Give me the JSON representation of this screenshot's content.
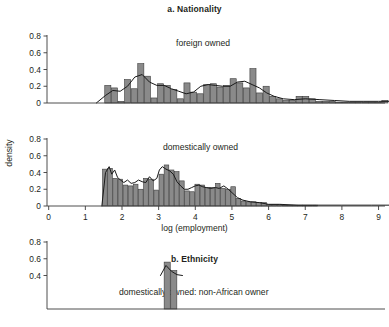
{
  "figure": {
    "panel_a_title": "a. Nationality",
    "panel_b_title": "b. Ethnicity",
    "ylabel": "density",
    "xlabel": "log (employment)",
    "bar_fill": "#8a8a8a",
    "bar_stroke": "#3b3b3b",
    "curve_color": "#1a1a1a",
    "axis_color": "#3b3b3b"
  },
  "chart_data": [
    {
      "type": "bar",
      "title": "a. Nationality",
      "series_label": "foreign owned",
      "panel": "top",
      "xlabel": "",
      "ylabel": "density",
      "xlim": [
        -0.3,
        9.4
      ],
      "ylim": [
        0,
        0.9
      ],
      "xticks": [
        0,
        1,
        2,
        3,
        4,
        5,
        6,
        7,
        8,
        9
      ],
      "yticks": [
        0,
        0.2,
        0.4,
        0.6,
        0.8
      ],
      "ytick_labels": [
        "0",
        "0.2",
        "0.4",
        "0.6",
        "0.8"
      ],
      "grid": false,
      "bin_width": 0.18,
      "bin_starts": [
        1.53,
        1.71,
        1.89,
        2.07,
        2.25,
        2.43,
        2.61,
        2.79,
        2.97,
        3.15,
        3.33,
        3.51,
        3.69,
        3.87,
        4.05,
        4.23,
        4.41,
        4.59,
        4.77,
        4.95,
        5.13,
        5.31,
        5.49,
        5.67,
        5.85,
        6.03,
        6.21,
        6.39,
        6.57,
        6.75,
        6.93,
        7.11,
        7.29,
        7.47,
        7.65,
        7.83,
        8.01,
        8.19,
        8.37,
        8.55,
        8.73,
        8.91,
        9.09
      ],
      "values": [
        0.21,
        0.18,
        0.02,
        0.28,
        0.17,
        0.47,
        0.32,
        0.06,
        0.23,
        0.21,
        0.16,
        0.05,
        0.24,
        0.13,
        0.11,
        0.22,
        0.23,
        0.19,
        0.21,
        0.29,
        0.24,
        0.18,
        0.41,
        0.12,
        0.2,
        0.08,
        0.05,
        0.03,
        0.03,
        0.08,
        0.08,
        0.05,
        0.02,
        0.02,
        0.02,
        0.01,
        0.01,
        0.01,
        0.01,
        0.01,
        0.01,
        0.01,
        0.03
      ],
      "density_curve": {
        "x": [
          1.3,
          1.55,
          1.75,
          1.95,
          2.15,
          2.35,
          2.55,
          2.75,
          2.95,
          3.15,
          3.35,
          3.55,
          3.75,
          3.95,
          4.15,
          4.35,
          4.55,
          4.75,
          4.95,
          5.15,
          5.35,
          5.55,
          5.75,
          5.95,
          6.15,
          6.4,
          6.7,
          7.0,
          7.4,
          7.8,
          8.2,
          8.6,
          9.0,
          9.3
        ],
        "y": [
          0.0,
          0.09,
          0.15,
          0.14,
          0.2,
          0.31,
          0.34,
          0.25,
          0.21,
          0.21,
          0.17,
          0.14,
          0.11,
          0.13,
          0.2,
          0.22,
          0.21,
          0.2,
          0.2,
          0.25,
          0.26,
          0.22,
          0.18,
          0.12,
          0.08,
          0.05,
          0.04,
          0.05,
          0.04,
          0.03,
          0.02,
          0.02,
          0.02,
          0.02
        ]
      }
    },
    {
      "type": "bar",
      "title": "a. Nationality",
      "series_label": "domestically owned",
      "panel": "middle",
      "xlabel": "log (employment)",
      "ylabel": "density",
      "xlim": [
        -0.3,
        9.4
      ],
      "ylim": [
        0,
        0.9
      ],
      "xticks": [
        0,
        1,
        2,
        3,
        4,
        5,
        6,
        7,
        8,
        9
      ],
      "yticks": [
        0,
        0.2,
        0.4,
        0.6,
        0.8
      ],
      "ytick_labels": [
        "0",
        "0.2",
        "0.4",
        "0.6",
        "0.8"
      ],
      "grid": false,
      "bin_width": 0.14,
      "bin_starts": [
        1.47,
        1.61,
        1.75,
        1.89,
        2.03,
        2.17,
        2.31,
        2.45,
        2.59,
        2.73,
        2.87,
        3.01,
        3.15,
        3.29,
        3.43,
        3.57,
        3.71,
        3.85,
        3.99,
        4.13,
        4.27,
        4.41,
        4.55,
        4.69,
        4.83,
        4.97,
        5.11,
        5.25,
        5.39,
        5.53,
        5.67,
        5.81,
        5.95,
        6.09,
        6.23,
        6.37,
        6.51,
        6.65,
        6.79,
        6.93,
        7.07,
        7.21
      ],
      "values": [
        0.44,
        0.45,
        0.33,
        0.32,
        0.25,
        0.24,
        0.26,
        0.2,
        0.33,
        0.32,
        0.19,
        0.38,
        0.49,
        0.43,
        0.41,
        0.3,
        0.18,
        0.17,
        0.26,
        0.25,
        0.22,
        0.22,
        0.27,
        0.21,
        0.2,
        0.23,
        0.09,
        0.06,
        0.05,
        0.05,
        0.04,
        0.04,
        0.02,
        0.02,
        0.02,
        0.01,
        0.01,
        0.01,
        0.01,
        0.01,
        0.01,
        0.01
      ],
      "density_curve": {
        "x": [
          1.45,
          1.55,
          1.65,
          1.72,
          1.8,
          1.88,
          1.96,
          2.05,
          2.15,
          2.25,
          2.35,
          2.45,
          2.55,
          2.65,
          2.75,
          2.85,
          2.95,
          3.02,
          3.1,
          3.2,
          3.3,
          3.4,
          3.5,
          3.6,
          3.7,
          3.8,
          3.9,
          4.0,
          4.1,
          4.2,
          4.3,
          4.42,
          4.55,
          4.65,
          4.78,
          4.9,
          5.0,
          5.15,
          5.3,
          5.5,
          5.75,
          6.0,
          6.3,
          6.8,
          7.3,
          8.0,
          8.8,
          9.3
        ],
        "y": [
          0.0,
          0.4,
          0.47,
          0.38,
          0.43,
          0.34,
          0.31,
          0.28,
          0.31,
          0.27,
          0.28,
          0.31,
          0.29,
          0.28,
          0.35,
          0.3,
          0.33,
          0.43,
          0.47,
          0.44,
          0.42,
          0.38,
          0.29,
          0.24,
          0.2,
          0.2,
          0.22,
          0.24,
          0.25,
          0.23,
          0.22,
          0.21,
          0.22,
          0.21,
          0.24,
          0.2,
          0.16,
          0.1,
          0.07,
          0.05,
          0.04,
          0.02,
          0.02,
          0.01,
          0.01,
          0.01,
          0.01,
          0.01
        ]
      }
    },
    {
      "type": "bar",
      "title": "b. Ethnicity",
      "series_label": "domestically owned: non-African owner",
      "panel": "bottom",
      "note": "panel cropped at bottom of screenshot",
      "xlabel": "",
      "ylabel": "",
      "xlim": [
        -0.3,
        9.4
      ],
      "ylim": [
        0,
        0.9
      ],
      "yticks": [
        0.4,
        0.6,
        0.8
      ],
      "ytick_labels": [
        "0.4",
        "0.6",
        "0.8"
      ],
      "grid": false,
      "bin_width": 0.18,
      "bin_starts": [
        3.15,
        3.33
      ],
      "values": [
        0.56,
        0.46
      ],
      "density_curve": {
        "x": [
          3.05,
          3.2,
          3.35,
          3.5,
          3.65
        ],
        "y": [
          0.4,
          0.52,
          0.45,
          0.41,
          0.4
        ]
      }
    }
  ]
}
